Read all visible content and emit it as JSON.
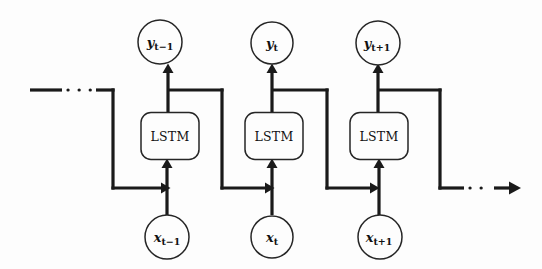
{
  "figure": {
    "width": 542,
    "height": 269,
    "background_color": "#fdfdfd",
    "line_color": "#1a1a1a",
    "node_stroke_color": "#262626",
    "text_color": "#111111"
  },
  "cells": [
    {
      "id": "cell-1",
      "label": "LSTM",
      "cx": 170,
      "cy": 136,
      "w": 58,
      "h": 47
    },
    {
      "id": "cell-2",
      "label": "LSTM",
      "cx": 274,
      "cy": 136,
      "w": 58,
      "h": 47
    },
    {
      "id": "cell-3",
      "label": "LSTM",
      "cx": 379,
      "cy": 136,
      "w": 58,
      "h": 47
    }
  ],
  "outputs": [
    {
      "id": "output-1",
      "base": "y",
      "sub": "t−1",
      "label": "y_{t-1}",
      "cx": 160,
      "cy": 42,
      "r": 22
    },
    {
      "id": "output-2",
      "base": "y",
      "sub": "t",
      "label": "y_t",
      "cx": 272,
      "cy": 43,
      "r": 21
    },
    {
      "id": "output-3",
      "base": "y",
      "sub": "t+1",
      "label": "y_{t+1}",
      "cx": 378,
      "cy": 43,
      "r": 22
    }
  ],
  "inputs": [
    {
      "id": "input-1",
      "base": "x",
      "sub": "t−1",
      "label": "x_{t-1}",
      "cx": 167,
      "cy": 237,
      "r": 22
    },
    {
      "id": "input-2",
      "base": "x",
      "sub": "t",
      "label": "x_t",
      "cx": 272,
      "cy": 237,
      "r": 21
    },
    {
      "id": "input-3",
      "base": "x",
      "sub": "t+1",
      "label": "x_{t+1}",
      "cx": 380,
      "cy": 237,
      "r": 22
    }
  ],
  "continuation": {
    "left_label": "incoming-recurrent-state-ellipsis",
    "right_label": "outgoing-recurrent-state-ellipsis"
  },
  "geometry": {
    "branch_y": 90,
    "feed_y": 188,
    "left_stub_x1": 30,
    "left_stub_x2": 62,
    "left_dots_x1": 64,
    "left_dots_x2": 96,
    "left_solid_x2": 113,
    "left_drop_x": 113,
    "right_drop_x": 440,
    "right_solid_x2": 463,
    "right_dots_x2": 492,
    "right_arrow_x": 517,
    "recur_out_x": [
      222,
      327,
      440
    ],
    "recur_in_x": [
      113,
      222,
      327
    ]
  }
}
